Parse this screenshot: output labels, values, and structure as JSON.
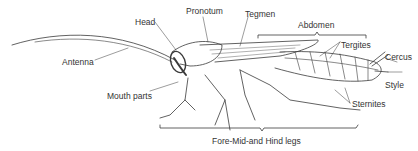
{
  "diagram": {
    "labels": {
      "head": "Head",
      "pronotum": "Pronotum",
      "tegmen": "Tegmen",
      "abdomen": "Abdomen",
      "tergites": "Tergites",
      "cercus": "Cercus",
      "style": "Style",
      "sternites": "Sternites",
      "antenna": "Antenna",
      "mouth_parts": "Mouth parts",
      "legs": "Fore-Mid-and Hind legs"
    },
    "colors": {
      "line": "#3a3a3a",
      "text": "#333333",
      "background": "#ffffff"
    }
  }
}
